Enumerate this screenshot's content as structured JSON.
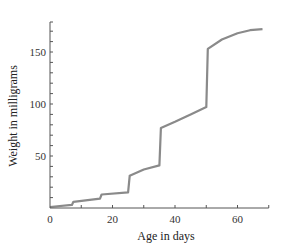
{
  "chart_data": {
    "type": "line",
    "title": "",
    "xlabel": "Age in days",
    "ylabel": "Weight in milligrams",
    "xlim": [
      0,
      70
    ],
    "ylim": [
      0,
      180
    ],
    "xticks": [
      0,
      20,
      40,
      60
    ],
    "yticks": [
      50,
      100,
      150
    ],
    "x_minor_ticks": [
      10,
      30,
      50,
      70
    ],
    "y_minor_ticks": [
      10,
      20,
      30,
      40,
      60,
      70,
      80,
      90,
      110,
      120,
      130,
      140,
      160,
      170
    ],
    "grid": false,
    "legend": null,
    "line_color": "#8a8a8a",
    "series": [
      {
        "name": "Weight",
        "x": [
          0,
          7,
          7.5,
          16,
          16.5,
          25,
          25.5,
          30,
          35,
          35.5,
          40,
          45,
          50,
          50.5,
          55,
          60,
          64,
          68
        ],
        "y": [
          1,
          3,
          6,
          9,
          13,
          15,
          31,
          37,
          41,
          77,
          83,
          90,
          97,
          153,
          162,
          168,
          171,
          172
        ]
      }
    ]
  }
}
